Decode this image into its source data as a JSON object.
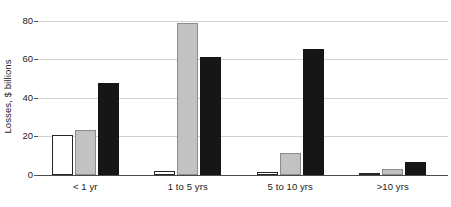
{
  "chart_data": {
    "type": "bar",
    "title": "",
    "subtitle": "",
    "xlabel": "",
    "ylabel": "Losses, $ billions",
    "categories": [
      "< 1 yr",
      "1 to 5 yrs",
      "5 to 10 yrs",
      ">10 yrs"
    ],
    "series": [
      {
        "name": "series-1",
        "color": "#ffffff",
        "values": [
          21,
          2,
          1.5,
          0.5
        ]
      },
      {
        "name": "series-2",
        "color": "#c2c2c2",
        "values": [
          23.5,
          79,
          11.5,
          3
        ]
      },
      {
        "name": "series-3",
        "color": "#161616",
        "values": [
          47.5,
          61,
          65.5,
          7
        ]
      }
    ],
    "ylim": [
      0,
      84
    ],
    "yticks": [
      0,
      20,
      40,
      60,
      80
    ],
    "ytick_labels": [
      "0",
      "20",
      "40",
      "60",
      "80"
    ],
    "grid": "horizontal",
    "legend": "none",
    "gridline_color": "#d2d2d2",
    "axis_color": "#4a4a4a",
    "background": "#ffffff"
  }
}
